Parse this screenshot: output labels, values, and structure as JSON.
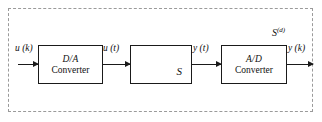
{
  "diagram": {
    "boundary_label": {
      "base": "S",
      "superscript": "(d)",
      "full": "S(d)"
    },
    "blocks": [
      {
        "id": "da",
        "line1": "D/A",
        "line2": "Converter"
      },
      {
        "id": "plant",
        "symbol": "S"
      },
      {
        "id": "ad",
        "line1": "A/D",
        "line2": "Converter"
      }
    ],
    "signals": {
      "input_discrete": "u (k)",
      "input_continuous": "u (t)",
      "output_continuous": "y (t)",
      "output_discrete": "y (k)"
    },
    "colors": {
      "block_stroke": "#1a1a1a",
      "boundary_stroke": "#9a9a9a",
      "arrow": "#1a1a1a",
      "background": "#ffffff",
      "text": "#111111"
    }
  }
}
